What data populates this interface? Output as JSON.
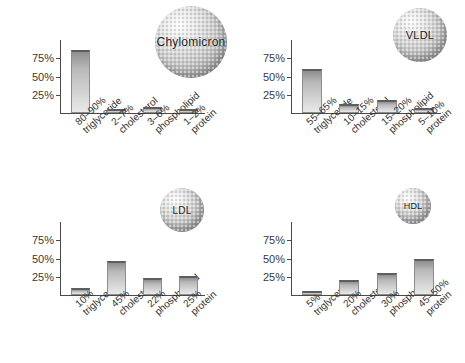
{
  "figure": {
    "axis_ticks": [
      "75%",
      "50%",
      "25%"
    ],
    "ylim": [
      0,
      100
    ]
  },
  "chart_data": [
    {
      "type": "bar",
      "title": "Chylomicron",
      "sphere_label": "Chylomicron",
      "sphere_size_px": 72,
      "categories": [
        "triglyceride",
        "cholesterol",
        "phospholipid",
        "protein"
      ],
      "range_labels": [
        "80–90%",
        "2–7%",
        "3–6%",
        "1–2%"
      ],
      "values": [
        87,
        5,
        8,
        4
      ],
      "xlabel": "",
      "ylabel": "",
      "ylim": [
        0,
        100
      ],
      "yticks": [
        75,
        50,
        25
      ],
      "ytick_labels": [
        "75%",
        "50%",
        "25%"
      ],
      "grid": false,
      "legend": "none"
    },
    {
      "type": "bar",
      "title": "VLDL",
      "sphere_label": "VLDL",
      "sphere_size_px": 54,
      "categories": [
        "triglyceride",
        "cholesterol",
        "phospholipid",
        "protein"
      ],
      "range_labels": [
        "55–65%",
        "10–15%",
        "15–20%",
        "5–10%"
      ],
      "values": [
        60,
        13,
        18,
        7
      ],
      "xlabel": "",
      "ylabel": "",
      "ylim": [
        0,
        100
      ],
      "yticks": [
        75,
        50,
        25
      ],
      "ytick_labels": [
        "75%",
        "50%",
        "25%"
      ],
      "grid": false,
      "legend": "none"
    },
    {
      "type": "bar",
      "title": "LDL",
      "sphere_label": "LDL",
      "sphere_size_px": 44,
      "categories": [
        "triglyceride",
        "cholesterol",
        "phospholipid",
        "protein"
      ],
      "range_labels": [
        "10%",
        "45%",
        "22%",
        "25%"
      ],
      "values": [
        10,
        46,
        23,
        26
      ],
      "xlabel": "",
      "ylabel": "",
      "ylim": [
        0,
        100
      ],
      "yticks": [
        75,
        50,
        25
      ],
      "ytick_labels": [
        "75%",
        "50%",
        "25%"
      ],
      "grid": false,
      "legend": "none"
    },
    {
      "type": "bar",
      "title": "HDL",
      "sphere_label": "HDL",
      "sphere_size_px": 36,
      "categories": [
        "triglyceride",
        "cholesterol",
        "phospholipid",
        "protein"
      ],
      "range_labels": [
        "5%",
        "20%",
        "30%",
        "45–50%"
      ],
      "values": [
        5,
        21,
        30,
        50
      ],
      "xlabel": "",
      "ylabel": "",
      "ylim": [
        0,
        100
      ],
      "yticks": [
        75,
        50,
        25
      ],
      "ytick_labels": [
        "75%",
        "50%",
        "25%"
      ],
      "grid": false,
      "legend": "none"
    }
  ],
  "colors": {
    "bar_top": "#5e5e5e",
    "bar_border": "#8d8d8d",
    "bar_fill_top": "#8f8f8f",
    "bar_fill_bottom": "#e9e9e9",
    "axis": "#4a4a4a",
    "text": "#2b2b2b",
    "background": "#ffffff"
  }
}
